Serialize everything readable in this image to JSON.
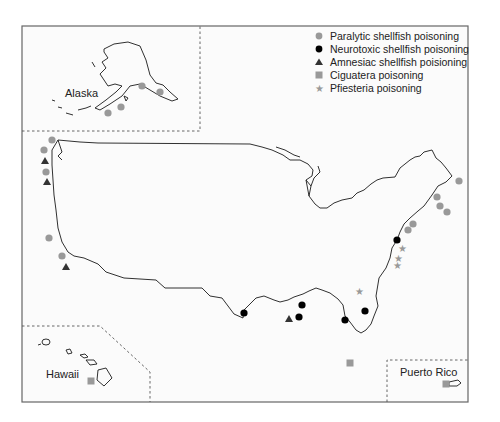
{
  "colors": {
    "paralytic": "#999999",
    "neurotoxic": "#000000",
    "amnesiac": "#333333",
    "ciguatera": "#999999",
    "pfiesteria": "#999999",
    "frame": "#666666",
    "coast": "#1a1a1a"
  },
  "legend": {
    "items": [
      {
        "key": "paralytic",
        "shape": "circle",
        "label": "Paralytic shellfish poisoning"
      },
      {
        "key": "neurotoxic",
        "shape": "circle",
        "label": "Neurotoxic shellfish poisoning"
      },
      {
        "key": "amnesiac",
        "shape": "triangle",
        "label": "Amnesiac shellfish poisioning"
      },
      {
        "key": "ciguatera",
        "shape": "square",
        "label": "Ciguatera poisoning"
      },
      {
        "key": "pfiesteria",
        "shape": "star",
        "label": "Pfiesteria poisoning"
      }
    ]
  },
  "insets": {
    "alaska": {
      "label": "Alaska"
    },
    "hawaii": {
      "label": "Hawaii"
    },
    "puerto_rico": {
      "label": "Puerto Rico"
    }
  },
  "markers": {
    "paralytic": [
      [
        108,
        113
      ],
      [
        121,
        107
      ],
      [
        142,
        86
      ],
      [
        160,
        92
      ],
      [
        52,
        140
      ],
      [
        44,
        150
      ],
      [
        46,
        172
      ],
      [
        49,
        238
      ],
      [
        62,
        256
      ],
      [
        459,
        181
      ],
      [
        437,
        197
      ],
      [
        440,
        206
      ],
      [
        447,
        212
      ],
      [
        413,
        224
      ],
      [
        408,
        230
      ]
    ],
    "neurotoxic": [
      [
        244,
        313
      ],
      [
        299,
        317
      ],
      [
        302,
        305
      ],
      [
        345,
        320
      ],
      [
        365,
        311
      ],
      [
        397,
        240
      ]
    ],
    "amnesiac": [
      [
        45,
        161
      ],
      [
        47,
        182
      ],
      [
        66,
        267
      ],
      [
        289,
        319
      ]
    ],
    "ciguatera": [
      [
        350,
        363
      ],
      [
        91,
        381
      ],
      [
        446,
        384
      ]
    ],
    "pfiesteria": [
      [
        402,
        248
      ],
      [
        398,
        258
      ],
      [
        397,
        265
      ],
      [
        359,
        291
      ]
    ]
  }
}
